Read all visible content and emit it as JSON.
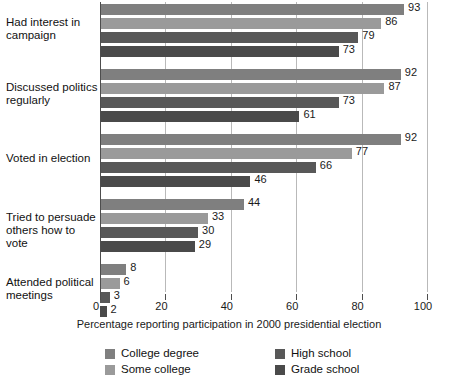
{
  "chart_data": {
    "type": "bar",
    "orientation": "horizontal",
    "title": "",
    "subtitle": "",
    "xlabel": "Percentage reporting participation in 2000 presidential election",
    "ylabel": "",
    "xlim": [
      0,
      100
    ],
    "xticks": [
      0,
      20,
      40,
      60,
      80,
      100
    ],
    "xtick_labels": [
      "0",
      "20",
      "40",
      "60",
      "80",
      "100"
    ],
    "grid": true,
    "grid_axis": "x",
    "legend_position": "bottom",
    "categories": [
      "Had interest in campaign",
      "Discussed politics regularly",
      "Voted in election",
      "Tried to persuade others how to vote",
      "Attended political meetings"
    ],
    "category_lines": [
      [
        "Had interest in",
        "campaign"
      ],
      [
        "Discussed politics",
        "regularly"
      ],
      [
        "Voted in election"
      ],
      [
        "Tried to persuade",
        "others how to vote"
      ],
      [
        "Attended political",
        "meetings"
      ]
    ],
    "series": [
      {
        "name": "College degree",
        "color": "#7f7f7f",
        "values": [
          93,
          92,
          92,
          44,
          8
        ]
      },
      {
        "name": "Some college",
        "color": "#9a9a9a",
        "values": [
          86,
          87,
          77,
          33,
          6
        ]
      },
      {
        "name": "High school",
        "color": "#585858",
        "values": [
          79,
          73,
          66,
          30,
          3
        ]
      },
      {
        "name": "Grade school",
        "color": "#4a4a4a",
        "values": [
          73,
          61,
          46,
          29,
          2
        ]
      }
    ],
    "legend_entries": [
      {
        "label": "College degree",
        "color": "#7f7f7f"
      },
      {
        "label": "Some college",
        "color": "#9a9a9a"
      },
      {
        "label": "High school",
        "color": "#585858"
      },
      {
        "label": "Grade school",
        "color": "#4a4a4a"
      }
    ],
    "colors": {
      "college_degree": "#7f7f7f",
      "some_college": "#9a9a9a",
      "high_school": "#585858",
      "grade_school": "#4a4a4a",
      "gridline": "#b9b9b9",
      "axis": "#4d4d4d",
      "text": "#1a1a1a",
      "background": "#ffffff"
    }
  }
}
